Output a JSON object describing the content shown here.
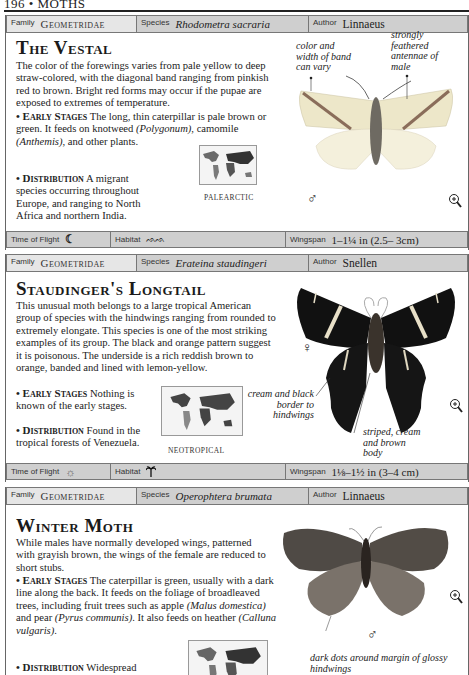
{
  "page": {
    "header": "196 • MOTHS"
  },
  "labels": {
    "family": "Family",
    "species": "Species",
    "author": "Author",
    "time_of_flight": "Time of Flight",
    "habitat": "Habitat",
    "wingspan": "Wingspan"
  },
  "entries": [
    {
      "family": "Geometridae",
      "species": "Rhodometra sacraria",
      "author": "Linnaeus",
      "title": "The Vestal",
      "intro": "The color of the forewings varies from pale yellow to deep straw-colored, with the diagonal band ranging from pinkish red to brown. Bright red forms may occur if the pupae are exposed to extremes of temperature.",
      "early_stages_heading": "• Early Stages",
      "early_stages_a": " The long, thin caterpillar is pale brown or green. It feeds on knotweed ",
      "early_stages_it1": "(Polygonum)",
      "early_stages_b": ", camomile ",
      "early_stages_it2": "(Anthemis)",
      "early_stages_c": ", and other plants.",
      "distribution_heading": "• Distribution",
      "distribution": " A migrant species occurring throughout Europe, and ranging to North Africa and northern India.",
      "map_label": "PALEARCTIC",
      "notes": [
        "color and width of band can vary",
        "strongly feathered antennae of male"
      ],
      "sex_symbol": "♂",
      "time_of_flight_icon": "moon-icon",
      "habitat_icon": "grassland-icon",
      "wingspan": "1–1¼ in (2.5– 3cm)"
    },
    {
      "family": "Geometridae",
      "species": "Erateina staudingeri",
      "author": "Snellen",
      "title": "Staudinger's Longtail",
      "intro": "This unusual moth belongs to a large tropical American group of species with the hindwings ranging from rounded to extremely elongate. This species is one of the most striking examples of its group. The black and orange pattern suggest it is poisonous. The underside is a rich reddish brown to orange, banded and lined with lemon-yellow.",
      "early_stages_heading": "• Early Stages",
      "early_stages": " Nothing is known of the early stages.",
      "distribution_heading": "• Distribution",
      "distribution": " Found in the tropical forests of Venezuela.",
      "map_label": "NEOTROPICAL",
      "notes": [
        "cream and black border to hindwings",
        "striped, cream and brown body"
      ],
      "sex_symbol": "♀",
      "time_of_flight_icon": "sun-icon",
      "habitat_icon": "palm-tree-icon",
      "wingspan": "1⅛–1½ in (3–4 cm)"
    },
    {
      "family": "Geometridae",
      "species": "Operophtera brumata",
      "author": "Linnaeus",
      "title": "Winter Moth",
      "intro": "While males have normally developed wings, patterned with grayish brown, the wings of the female are reduced to short stubs.",
      "early_stages_heading": "• Early Stages",
      "early_stages_a": " The caterpillar is green, usually with a dark line along the back. It feeds on the foliage of broadleaved trees, including fruit trees such as apple ",
      "early_stages_it1": "(Malus domestica)",
      "early_stages_b": " and pear ",
      "early_stages_it2": "(Pyrus communis)",
      "early_stages_c": ". It also feeds on heather ",
      "early_stages_it3": "(Calluna vulgaris)",
      "early_stages_d": ".",
      "distribution_heading": "• Distribution",
      "distribution": " Widespread and common throughout Europe,",
      "notes": [
        "dark dots around margin of glossy hindwings"
      ],
      "sex_symbol": "♂"
    }
  ]
}
